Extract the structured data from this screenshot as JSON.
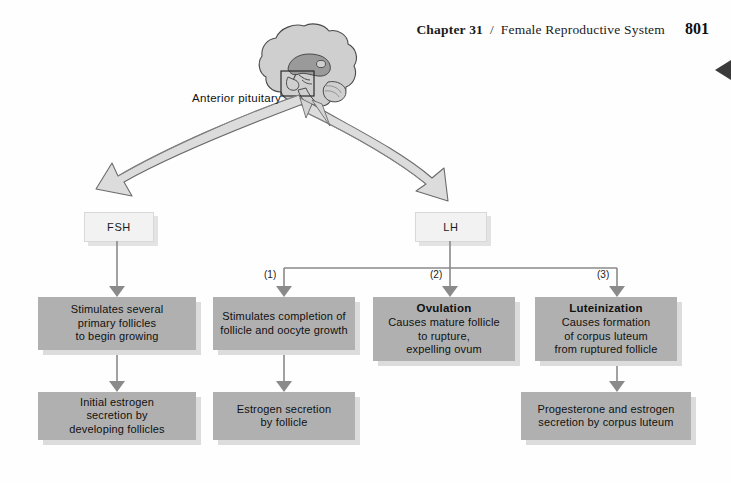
{
  "running_head": {
    "chapter": "Chapter 31",
    "separator": "/",
    "title": "Female Reproductive System",
    "page_number": "801"
  },
  "diagram": {
    "source_label": "Anterior pituitary",
    "hormones": [
      {
        "id": "fsh",
        "label": "FSH"
      },
      {
        "id": "lh",
        "label": "LH"
      }
    ],
    "branch_numbers": [
      "(1)",
      "(2)",
      "(3)"
    ],
    "columns": [
      {
        "id": "fsh-follicles",
        "primary": {
          "header": "",
          "lines": [
            "Stimulates several",
            "primary follicles",
            "to begin growing"
          ]
        },
        "secondary": {
          "lines": [
            "Initial estrogen",
            "secretion by",
            "developing follicles"
          ]
        }
      },
      {
        "id": "lh-follicle-growth",
        "primary": {
          "header": "",
          "lines": [
            "Stimulates completion of",
            "follicle and oocyte growth"
          ]
        },
        "secondary": {
          "lines": [
            "Estrogen secretion",
            "by follicle"
          ]
        }
      },
      {
        "id": "lh-ovulation",
        "primary": {
          "header": "Ovulation",
          "lines": [
            "Causes mature follicle",
            "to rupture,",
            "expelling ovum"
          ]
        },
        "secondary": null
      },
      {
        "id": "lh-luteinization",
        "primary": {
          "header": "Luteinization",
          "lines": [
            "Causes formation",
            "of corpus luteum",
            "from ruptured follicle"
          ]
        },
        "secondary": {
          "lines": [
            "Progesterone and estrogen",
            "secretion by corpus luteum"
          ]
        }
      }
    ]
  },
  "colors": {
    "content_box_fill": "#b0b0b0",
    "content_box_shadow": "#dcdcdc",
    "hormone_box_fill": "#f2f2f2",
    "ribbon_fill": "#d9d9d9",
    "ribbon_stroke": "#6b6b6b",
    "connector": "#8a8a8a",
    "brain_fill": "#cfcfcf",
    "brain_inner": "#9a9a9a",
    "edge_marker": "#3a3a3a"
  }
}
